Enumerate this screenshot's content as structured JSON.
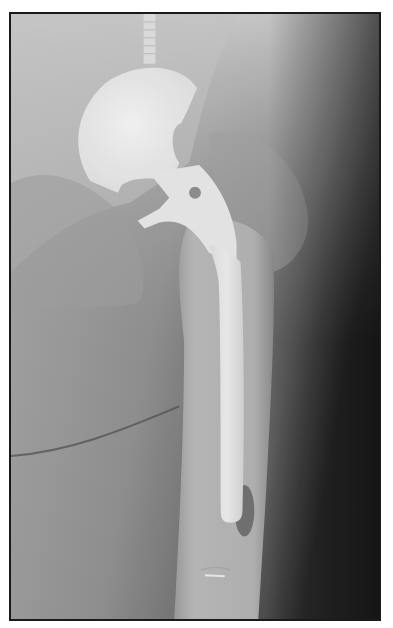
{
  "image": {
    "subject": "hip radiograph with total hip arthroplasty (femoral stem and acetabular cup)",
    "border_color": "#1a1a1a",
    "background_color": "#ffffff",
    "tones": {
      "implant": "#e8e8e8",
      "bone_light": "#b5b5b5",
      "soft_tissue": "#8a8a8a",
      "dark_edge": "#303030"
    }
  }
}
